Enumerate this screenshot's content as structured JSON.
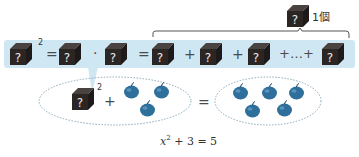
{
  "top_row": {
    "items": [
      {
        "type": "cube",
        "label": "?",
        "superscript": "2"
      },
      {
        "type": "op",
        "label": "="
      },
      {
        "type": "cube",
        "label": "?"
      },
      {
        "type": "op",
        "label": "·"
      },
      {
        "type": "cube",
        "label": "?"
      },
      {
        "type": "op",
        "label": "="
      },
      {
        "type": "cube",
        "label": "?"
      },
      {
        "type": "op",
        "label": "+"
      },
      {
        "type": "cube",
        "label": "?"
      },
      {
        "type": "op",
        "label": "+"
      },
      {
        "type": "cube",
        "label": "?"
      },
      {
        "type": "op",
        "label": "+…+"
      },
      {
        "type": "cube",
        "label": "?"
      }
    ]
  },
  "brace": {
    "cube_label": "?",
    "count_label": "1個"
  },
  "left_group": {
    "cube_label": "?",
    "superscript": "2",
    "plus": "+",
    "apple_count": 3
  },
  "equals": "=",
  "right_group": {
    "apple_count": 5
  },
  "equation": {
    "base": "x",
    "exp": "2",
    "rest": "+ 3 = 5"
  },
  "colors": {
    "band": "#cfe7f3",
    "cube": "#2b2523",
    "apple": "#2f6f9c",
    "ellipse": "#8aa8b8"
  }
}
